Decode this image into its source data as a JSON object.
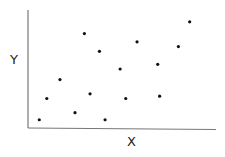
{
  "chart_data": {
    "type": "scatter",
    "title": "",
    "xlabel": "X",
    "ylabel": "Y",
    "grid": false,
    "legend": null,
    "x_ticks": [],
    "y_ticks": [],
    "xlim": [
      0,
      100
    ],
    "ylim": [
      0,
      100
    ],
    "points": [
      {
        "x": 6,
        "y": 7
      },
      {
        "x": 10,
        "y": 25
      },
      {
        "x": 17,
        "y": 41
      },
      {
        "x": 25,
        "y": 13
      },
      {
        "x": 30,
        "y": 80
      },
      {
        "x": 33,
        "y": 29
      },
      {
        "x": 38,
        "y": 65
      },
      {
        "x": 41,
        "y": 7
      },
      {
        "x": 49,
        "y": 50
      },
      {
        "x": 52,
        "y": 25
      },
      {
        "x": 58,
        "y": 73
      },
      {
        "x": 69,
        "y": 54
      },
      {
        "x": 70,
        "y": 27
      },
      {
        "x": 80,
        "y": 69
      },
      {
        "x": 86,
        "y": 90
      }
    ],
    "marker_color": "#111111",
    "axis_color": "#777777"
  }
}
